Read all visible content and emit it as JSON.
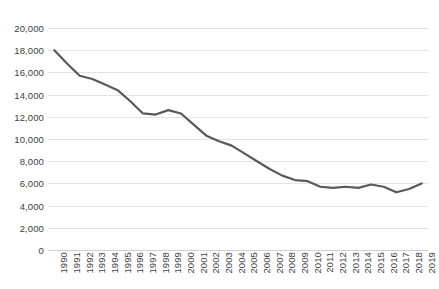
{
  "chart_data": {
    "type": "line",
    "title": "",
    "subtitle": "",
    "xlabel": "",
    "ylabel": "",
    "legend": [],
    "legend_position": "none",
    "grid": true,
    "grid_axis": "y",
    "ylim": [
      0,
      20000
    ],
    "ytick_step": 2000,
    "ytick_labels": [
      "0",
      "2,000",
      "4,000",
      "6,000",
      "8,000",
      "10,000",
      "12,000",
      "14,000",
      "16,000",
      "18,000",
      "20,000"
    ],
    "ytick_values": [
      0,
      2000,
      4000,
      6000,
      8000,
      10000,
      12000,
      14000,
      16000,
      18000,
      20000
    ],
    "categories": [
      "1990",
      "1991",
      "1992",
      "1993",
      "1994",
      "1995",
      "1996",
      "1997",
      "1998",
      "1999",
      "2000",
      "2001",
      "2002",
      "2003",
      "2004",
      "2005",
      "2006",
      "2007",
      "2008",
      "2009",
      "2010",
      "2011",
      "2012",
      "2013",
      "2014",
      "2015",
      "2016",
      "2017",
      "2018",
      "2019"
    ],
    "values": [
      18000,
      16800,
      15700,
      15400,
      14900,
      14400,
      13400,
      12300,
      12200,
      12600,
      12300,
      11300,
      10300,
      9800,
      9400,
      8700,
      8000,
      7300,
      6700,
      6300,
      6200,
      5700,
      5600,
      5700,
      5600,
      5900,
      5700,
      5200,
      5500,
      6000
    ],
    "line_color": "#595959",
    "line_width": 2.2,
    "markers": false
  },
  "axis": {
    "y_label_color": "#404040",
    "x_label_color": "#404040",
    "gridline_color": "#e3e3e3"
  }
}
